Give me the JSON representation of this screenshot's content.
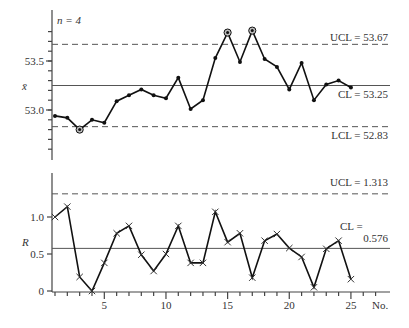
{
  "chart_data": [
    {
      "type": "line",
      "title": "X-bar control chart",
      "annotation": "n = 4",
      "ylabel": "x̄",
      "xlabel": "No.",
      "x": [
        1,
        2,
        3,
        4,
        5,
        6,
        7,
        8,
        9,
        10,
        11,
        12,
        13,
        14,
        15,
        16,
        17,
        18,
        19,
        20,
        21,
        22,
        23,
        24,
        25
      ],
      "values": [
        52.94,
        52.92,
        52.8,
        52.9,
        52.87,
        53.09,
        53.15,
        53.21,
        53.15,
        53.12,
        53.33,
        53.01,
        53.1,
        53.53,
        53.79,
        53.49,
        53.81,
        53.52,
        53.44,
        53.21,
        53.48,
        53.1,
        53.26,
        53.3,
        53.23
      ],
      "out_of_control_points": [
        3,
        15,
        17
      ],
      "yticks": [
        53.0,
        53.5
      ],
      "ytick_labels": [
        "53.0",
        "53.5"
      ],
      "ylim": [
        52.5,
        54.0
      ],
      "ucl": 53.67,
      "cl": 53.25,
      "lcl": 52.83,
      "ucl_label": "UCL = 53.67",
      "cl_label": "CL = 53.25",
      "lcl_label": "LCL = 52.83",
      "marker": "dot"
    },
    {
      "type": "line",
      "title": "R control chart",
      "ylabel": "R",
      "xlabel": "No.",
      "x": [
        1,
        2,
        3,
        4,
        5,
        6,
        7,
        8,
        9,
        10,
        11,
        12,
        13,
        14,
        15,
        16,
        17,
        18,
        19,
        20,
        21,
        22,
        23,
        24,
        25
      ],
      "values": [
        1.0,
        1.14,
        0.19,
        0.0,
        0.38,
        0.78,
        0.88,
        0.49,
        0.27,
        0.5,
        0.88,
        0.38,
        0.38,
        1.07,
        0.66,
        0.78,
        0.18,
        0.68,
        0.77,
        0.58,
        0.46,
        0.05,
        0.57,
        0.68,
        0.16
      ],
      "yticks": [
        0,
        0.5,
        1.0
      ],
      "ytick_labels": [
        "0",
        "0.5",
        "1.0"
      ],
      "xticks": [
        5,
        10,
        15,
        20,
        25
      ],
      "xtick_labels": [
        "5",
        "10",
        "15",
        "20",
        "25"
      ],
      "ylim": [
        0,
        1.6
      ],
      "ucl": 1.313,
      "cl": 0.576,
      "ucl_label": "UCL = 1.313",
      "cl_label_line1": "CL =",
      "cl_label_line2": "0.576",
      "marker": "x"
    }
  ]
}
